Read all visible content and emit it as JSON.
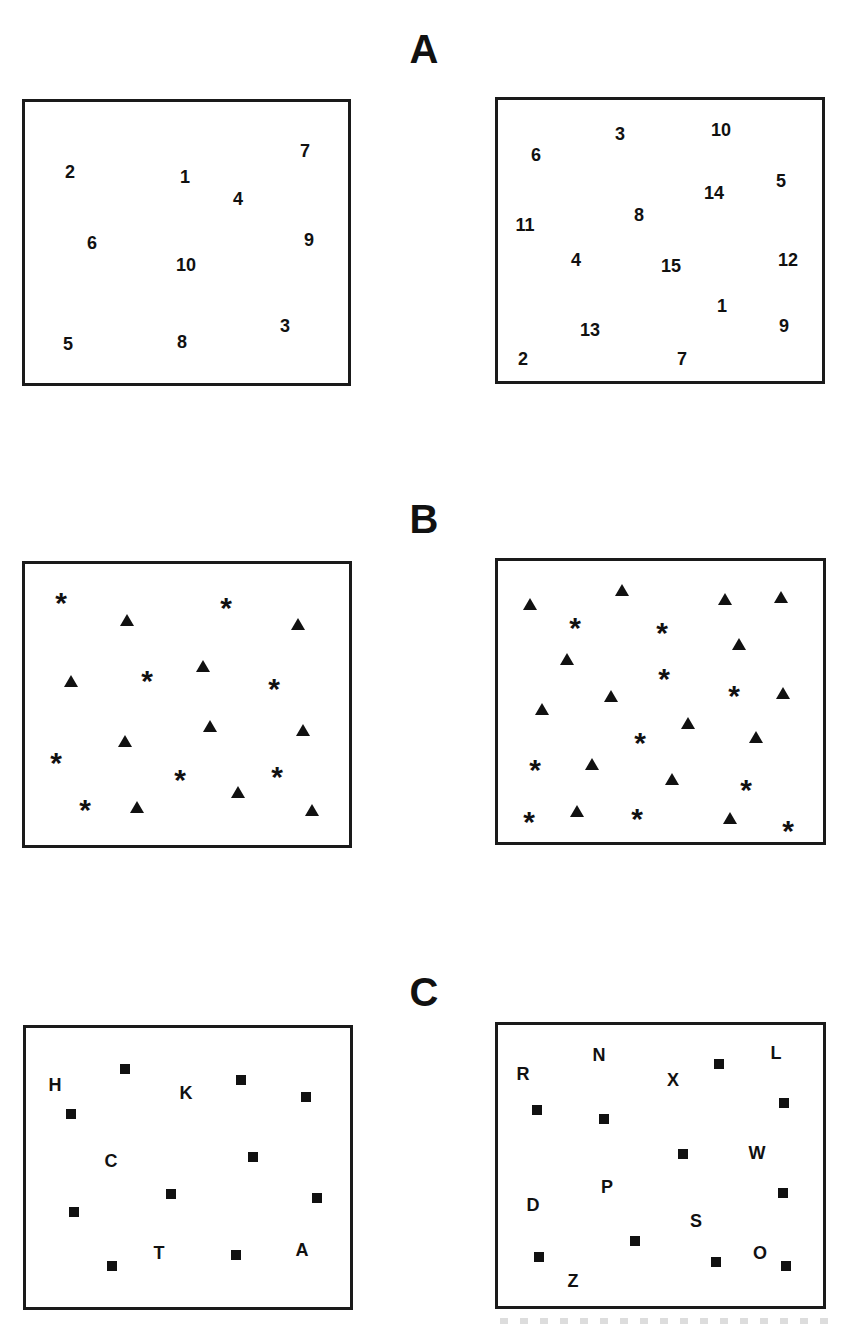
{
  "sections": [
    {
      "label": "A",
      "label_pos": [
        424,
        49
      ],
      "panels": [
        {
          "box": [
            22,
            99,
            329,
            287
          ],
          "items": [
            {
              "type": "number",
              "text": "2",
              "x": 70,
              "y": 172
            },
            {
              "type": "number",
              "text": "1",
              "x": 185,
              "y": 177
            },
            {
              "type": "number",
              "text": "7",
              "x": 305,
              "y": 151
            },
            {
              "type": "number",
              "text": "4",
              "x": 238,
              "y": 199
            },
            {
              "type": "number",
              "text": "6",
              "x": 92,
              "y": 243
            },
            {
              "type": "number",
              "text": "9",
              "x": 309,
              "y": 240
            },
            {
              "type": "number",
              "text": "10",
              "x": 186,
              "y": 265
            },
            {
              "type": "number",
              "text": "3",
              "x": 285,
              "y": 326
            },
            {
              "type": "number",
              "text": "5",
              "x": 68,
              "y": 344
            },
            {
              "type": "number",
              "text": "8",
              "x": 182,
              "y": 342
            }
          ]
        },
        {
          "box": [
            495,
            97,
            330,
            287
          ],
          "items": [
            {
              "type": "number",
              "text": "6",
              "x": 536,
              "y": 155
            },
            {
              "type": "number",
              "text": "3",
              "x": 620,
              "y": 134
            },
            {
              "type": "number",
              "text": "10",
              "x": 721,
              "y": 130
            },
            {
              "type": "number",
              "text": "5",
              "x": 781,
              "y": 181
            },
            {
              "type": "number",
              "text": "14",
              "x": 714,
              "y": 193
            },
            {
              "type": "number",
              "text": "8",
              "x": 639,
              "y": 215
            },
            {
              "type": "number",
              "text": "11",
              "x": 525,
              "y": 225
            },
            {
              "type": "number",
              "text": "4",
              "x": 576,
              "y": 260
            },
            {
              "type": "number",
              "text": "15",
              "x": 671,
              "y": 266
            },
            {
              "type": "number",
              "text": "12",
              "x": 788,
              "y": 260
            },
            {
              "type": "number",
              "text": "1",
              "x": 722,
              "y": 306
            },
            {
              "type": "number",
              "text": "9",
              "x": 784,
              "y": 326
            },
            {
              "type": "number",
              "text": "13",
              "x": 590,
              "y": 330
            },
            {
              "type": "number",
              "text": "2",
              "x": 523,
              "y": 359
            },
            {
              "type": "number",
              "text": "7",
              "x": 682,
              "y": 359
            }
          ]
        }
      ]
    },
    {
      "label": "B",
      "label_pos": [
        424,
        519
      ],
      "panels": [
        {
          "box": [
            22,
            561,
            330,
            287
          ],
          "items": [
            {
              "type": "star",
              "x": 61,
              "y": 597
            },
            {
              "type": "star",
              "x": 226,
              "y": 602
            },
            {
              "type": "triangle",
              "x": 127,
              "y": 620
            },
            {
              "type": "triangle",
              "x": 298,
              "y": 624
            },
            {
              "type": "triangle",
              "x": 71,
              "y": 681
            },
            {
              "type": "star",
              "x": 147,
              "y": 675
            },
            {
              "type": "triangle",
              "x": 203,
              "y": 666
            },
            {
              "type": "star",
              "x": 274,
              "y": 683
            },
            {
              "type": "triangle",
              "x": 125,
              "y": 741
            },
            {
              "type": "triangle",
              "x": 210,
              "y": 726
            },
            {
              "type": "triangle",
              "x": 303,
              "y": 730
            },
            {
              "type": "star",
              "x": 56,
              "y": 757
            },
            {
              "type": "star",
              "x": 180,
              "y": 774
            },
            {
              "type": "star",
              "x": 277,
              "y": 771
            },
            {
              "type": "triangle",
              "x": 238,
              "y": 792
            },
            {
              "type": "star",
              "x": 85,
              "y": 804
            },
            {
              "type": "triangle",
              "x": 137,
              "y": 807
            },
            {
              "type": "triangle",
              "x": 312,
              "y": 810
            }
          ]
        },
        {
          "box": [
            495,
            558,
            331,
            287
          ],
          "items": [
            {
              "type": "triangle",
              "x": 530,
              "y": 604
            },
            {
              "type": "triangle",
              "x": 622,
              "y": 590
            },
            {
              "type": "triangle",
              "x": 725,
              "y": 599
            },
            {
              "type": "triangle",
              "x": 781,
              "y": 597
            },
            {
              "type": "star",
              "x": 575,
              "y": 622
            },
            {
              "type": "star",
              "x": 662,
              "y": 627
            },
            {
              "type": "triangle",
              "x": 739,
              "y": 644
            },
            {
              "type": "triangle",
              "x": 567,
              "y": 659
            },
            {
              "type": "star",
              "x": 664,
              "y": 673
            },
            {
              "type": "star",
              "x": 734,
              "y": 690
            },
            {
              "type": "triangle",
              "x": 611,
              "y": 696
            },
            {
              "type": "triangle",
              "x": 783,
              "y": 693
            },
            {
              "type": "triangle",
              "x": 542,
              "y": 709
            },
            {
              "type": "triangle",
              "x": 688,
              "y": 723
            },
            {
              "type": "triangle",
              "x": 756,
              "y": 737
            },
            {
              "type": "star",
              "x": 640,
              "y": 737
            },
            {
              "type": "star",
              "x": 535,
              "y": 764
            },
            {
              "type": "triangle",
              "x": 592,
              "y": 764
            },
            {
              "type": "triangle",
              "x": 672,
              "y": 779
            },
            {
              "type": "star",
              "x": 746,
              "y": 784
            },
            {
              "type": "star",
              "x": 529,
              "y": 816
            },
            {
              "type": "triangle",
              "x": 577,
              "y": 811
            },
            {
              "type": "star",
              "x": 637,
              "y": 813
            },
            {
              "type": "triangle",
              "x": 730,
              "y": 818
            },
            {
              "type": "star",
              "x": 788,
              "y": 825
            }
          ]
        }
      ]
    },
    {
      "label": "C",
      "label_pos": [
        424,
        992
      ],
      "panels": [
        {
          "box": [
            23,
            1025,
            330,
            285
          ],
          "items": [
            {
              "type": "square",
              "x": 125,
              "y": 1069
            },
            {
              "type": "letter",
              "text": "H",
              "x": 55,
              "y": 1085
            },
            {
              "type": "letter",
              "text": "K",
              "x": 186,
              "y": 1093
            },
            {
              "type": "square",
              "x": 241,
              "y": 1080
            },
            {
              "type": "square",
              "x": 306,
              "y": 1097
            },
            {
              "type": "square",
              "x": 71,
              "y": 1114
            },
            {
              "type": "letter",
              "text": "C",
              "x": 111,
              "y": 1161
            },
            {
              "type": "square",
              "x": 253,
              "y": 1157
            },
            {
              "type": "square",
              "x": 171,
              "y": 1194
            },
            {
              "type": "square",
              "x": 317,
              "y": 1198
            },
            {
              "type": "square",
              "x": 74,
              "y": 1212
            },
            {
              "type": "letter",
              "text": "T",
              "x": 159,
              "y": 1253
            },
            {
              "type": "letter",
              "text": "A",
              "x": 302,
              "y": 1250
            },
            {
              "type": "square",
              "x": 236,
              "y": 1255
            },
            {
              "type": "square",
              "x": 112,
              "y": 1266
            }
          ]
        },
        {
          "box": [
            495,
            1022,
            331,
            287
          ],
          "items": [
            {
              "type": "letter",
              "text": "N",
              "x": 599,
              "y": 1055
            },
            {
              "type": "letter",
              "text": "L",
              "x": 776,
              "y": 1053
            },
            {
              "type": "square",
              "x": 719,
              "y": 1064
            },
            {
              "type": "letter",
              "text": "R",
              "x": 523,
              "y": 1074
            },
            {
              "type": "letter",
              "text": "X",
              "x": 673,
              "y": 1080
            },
            {
              "type": "square",
              "x": 784,
              "y": 1103
            },
            {
              "type": "square",
              "x": 537,
              "y": 1110
            },
            {
              "type": "square",
              "x": 604,
              "y": 1119
            },
            {
              "type": "square",
              "x": 683,
              "y": 1154
            },
            {
              "type": "letter",
              "text": "W",
              "x": 757,
              "y": 1153
            },
            {
              "type": "letter",
              "text": "P",
              "x": 607,
              "y": 1187
            },
            {
              "type": "square",
              "x": 783,
              "y": 1193
            },
            {
              "type": "letter",
              "text": "D",
              "x": 533,
              "y": 1205
            },
            {
              "type": "letter",
              "text": "S",
              "x": 696,
              "y": 1221
            },
            {
              "type": "square",
              "x": 635,
              "y": 1241
            },
            {
              "type": "square",
              "x": 539,
              "y": 1257
            },
            {
              "type": "letter",
              "text": "O",
              "x": 760,
              "y": 1253
            },
            {
              "type": "square",
              "x": 716,
              "y": 1262
            },
            {
              "type": "square",
              "x": 786,
              "y": 1266
            },
            {
              "type": "letter",
              "text": "Z",
              "x": 573,
              "y": 1281
            }
          ]
        }
      ]
    }
  ]
}
